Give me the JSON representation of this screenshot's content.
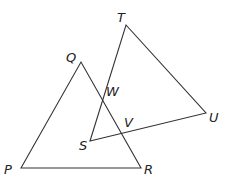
{
  "diagram": {
    "points": {
      "P": {
        "label": "P",
        "x": 21,
        "y": 168,
        "lx": 4,
        "ly": 174
      },
      "Q": {
        "label": "Q",
        "x": 81,
        "y": 62,
        "lx": 66,
        "ly": 62
      },
      "R": {
        "label": "R",
        "x": 141,
        "y": 168,
        "lx": 144,
        "ly": 174
      },
      "S": {
        "label": "S",
        "x": 90,
        "y": 141,
        "lx": 79,
        "ly": 150
      },
      "T": {
        "label": "T",
        "x": 126,
        "y": 25,
        "lx": 117,
        "ly": 22
      },
      "U": {
        "label": "U",
        "x": 206,
        "y": 113,
        "lx": 209,
        "ly": 122
      },
      "V": {
        "label": "V",
        "x": 123,
        "y": 133,
        "lx": 124,
        "ly": 127
      },
      "W": {
        "label": "W",
        "x": 103,
        "y": 97,
        "lx": 106,
        "ly": 96
      }
    },
    "triangles": [
      {
        "name": "PQR",
        "vertices": [
          "P",
          "Q",
          "R"
        ]
      },
      {
        "name": "STU",
        "vertices": [
          "S",
          "T",
          "U"
        ]
      }
    ]
  }
}
